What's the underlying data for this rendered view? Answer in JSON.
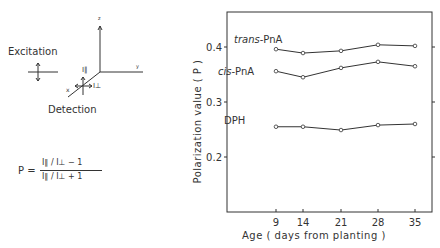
{
  "diagram": {
    "excitation_label": "Excitation",
    "detection_label": "Detection",
    "axes": {
      "x": "x",
      "y": "y",
      "z": "z"
    },
    "i_parallel": "I∥",
    "i_perp": "I⊥",
    "formula": {
      "lhs": "P =",
      "numerator": "I∥ / I⊥  − 1",
      "denominator": "I∥ / I⊥  + 1"
    }
  },
  "chart_data": {
    "type": "line",
    "title": "",
    "xlabel": "Age ( days from planting )",
    "ylabel": "Polarization value ( P )",
    "x": [
      9,
      14,
      21,
      28,
      35
    ],
    "x_tick_labels": [
      "9",
      "14",
      "21",
      "28",
      "35"
    ],
    "y_tick_labels": [
      "0.2",
      "0.3",
      "0.4"
    ],
    "ylim": [
      0.1,
      0.46
    ],
    "grid": false,
    "legend": "inline labels",
    "series": [
      {
        "name": "trans-PnA",
        "values": [
          0.396,
          0.389,
          0.393,
          0.404,
          0.402
        ]
      },
      {
        "name": "cis-PnA",
        "values": [
          0.356,
          0.345,
          0.362,
          0.373,
          0.365
        ]
      },
      {
        "name": "DPH",
        "values": [
          0.255,
          0.255,
          0.249,
          0.258,
          0.26
        ]
      }
    ],
    "series_labels": {
      "trans_prefix": "trans",
      "cis_prefix": "cis",
      "suffix": "-PnA",
      "dph": "DPH"
    }
  }
}
